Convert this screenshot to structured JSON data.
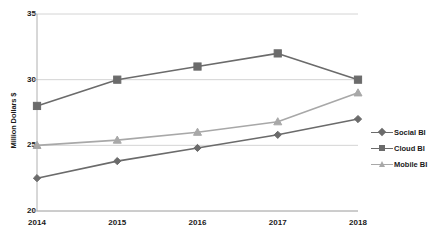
{
  "chart_data": {
    "type": "line",
    "title": "",
    "xlabel": "",
    "ylabel": "Million Dollars $",
    "categories": [
      "2014",
      "2015",
      "2016",
      "2017",
      "2018"
    ],
    "xlim": [
      2014,
      2018
    ],
    "ylim": [
      20,
      35
    ],
    "y_ticks": [
      "20",
      "25",
      "30",
      "35"
    ],
    "y_tick_values": [
      20,
      25,
      30,
      35
    ],
    "grid": "horizontal",
    "legend_position": "right",
    "series": [
      {
        "name": "Social BI",
        "marker": "diamond",
        "color": "#6b6b6b",
        "values": [
          22.5,
          23.8,
          24.8,
          25.8,
          27.0
        ]
      },
      {
        "name": "Cloud BI",
        "marker": "square",
        "color": "#6b6b6b",
        "values": [
          28.0,
          30.0,
          31.0,
          32.0,
          30.0
        ]
      },
      {
        "name": "Mobile BI",
        "marker": "triangle",
        "color": "#a8a8a8",
        "values": [
          25.0,
          25.4,
          26.0,
          26.8,
          29.0
        ]
      }
    ]
  },
  "colors": {
    "grid": "#d4d4d4",
    "axis": "#b0b0b0",
    "text": "#1a1a1a",
    "background": "#ffffff"
  }
}
